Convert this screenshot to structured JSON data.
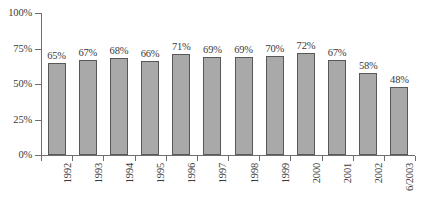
{
  "chart_data": {
    "type": "bar",
    "title": "",
    "subtitle": "",
    "xlabel": "",
    "ylabel": "",
    "ylim": [
      0,
      100
    ],
    "grid": false,
    "legend": "none",
    "y_ticks": [
      "0%",
      "25%",
      "50%",
      "75%",
      "100%"
    ],
    "y_tick_values": [
      0,
      25,
      50,
      75,
      100
    ],
    "categories": [
      "1992",
      "1993",
      "1994",
      "1995",
      "1996",
      "1997",
      "1998",
      "1999",
      "2000",
      "2001",
      "2002",
      "6/2003"
    ],
    "values": [
      65,
      67,
      68,
      66,
      71,
      69,
      69,
      70,
      72,
      67,
      58,
      48
    ],
    "data_labels": [
      "65%",
      "67%",
      "68%",
      "66%",
      "71%",
      "69%",
      "69%",
      "70%",
      "72%",
      "67%",
      "58%",
      "48%"
    ],
    "series": [
      {
        "name": "",
        "values": [
          65,
          67,
          68,
          66,
          71,
          69,
          69,
          70,
          72,
          67,
          58,
          48
        ]
      }
    ],
    "style": {
      "bar_fill": "#a9a9a9",
      "bar_border": "#585858",
      "axis_color": "#6e6e6e",
      "text_color": "#3a3a3a",
      "background": "#ffffff"
    }
  }
}
